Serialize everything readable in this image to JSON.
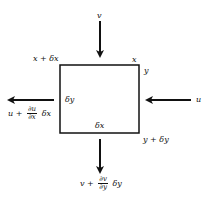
{
  "diagram": {
    "type": "fluid-element-control-volume",
    "element": {
      "width_label": "δx",
      "height_label": "δy"
    },
    "corners": {
      "top_left": "x + δx",
      "top_right_x": "x",
      "top_right_y": "y",
      "bottom_right": "y + δy"
    },
    "flows": {
      "top_in": {
        "label": "v",
        "direction": "down"
      },
      "right_in": {
        "label": "u",
        "direction": "left"
      },
      "left_out": {
        "prefix": "u +",
        "frac_num": "∂u",
        "frac_den": "∂x",
        "suffix": "δx",
        "direction": "left"
      },
      "bottom_out": {
        "prefix": "v +",
        "frac_num": "∂v",
        "frac_den": "∂y",
        "suffix": "δy",
        "direction": "down"
      }
    },
    "colors": {
      "line": "#111111",
      "background": "#ffffff"
    }
  }
}
